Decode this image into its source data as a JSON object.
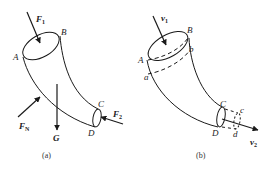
{
  "panel_a": {
    "caption": "(a)",
    "labels": {
      "A": "A",
      "B": "B",
      "C": "C",
      "D": "D"
    },
    "forces": {
      "F1": {
        "base": "F",
        "sub": "1"
      },
      "F2": {
        "base": "F",
        "sub": "2"
      },
      "FN": {
        "base": "F",
        "sub": "N"
      },
      "G": {
        "base": "G"
      }
    }
  },
  "panel_b": {
    "caption": "(b)",
    "labels": {
      "A": "A",
      "B": "B",
      "C": "C",
      "D": "D",
      "a": "a",
      "b": "b",
      "c": "c",
      "d": "d"
    },
    "velocities": {
      "v1": {
        "base": "v",
        "sub": "1"
      },
      "v2": {
        "base": "v",
        "sub": "2"
      }
    }
  },
  "colors": {
    "stroke": "#1a1a1a",
    "background": "#ffffff"
  }
}
